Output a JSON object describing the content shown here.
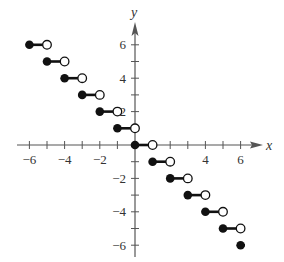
{
  "chart_data": {
    "type": "step",
    "title": "",
    "xlabel": "x",
    "ylabel": "y",
    "xlim": [
      -6.3,
      7
    ],
    "ylim": [
      -6.3,
      7
    ],
    "x_ticks": [
      -6,
      -5,
      -4,
      -3,
      -2,
      -1,
      1,
      2,
      3,
      4,
      5,
      6
    ],
    "x_tick_labels": [
      "-6",
      "-4",
      "-2",
      "4",
      "6"
    ],
    "x_tick_label_values": [
      -6,
      -4,
      -2,
      4,
      6
    ],
    "y_ticks": [
      -6,
      -5,
      -4,
      -3,
      -2,
      -1,
      1,
      2,
      3,
      4,
      5,
      6
    ],
    "y_tick_labels": [
      "6",
      "4",
      "2",
      "-2",
      "-4",
      "-6"
    ],
    "y_tick_label_values": [
      6,
      4,
      2,
      -2,
      -4,
      -6
    ],
    "grid": false,
    "function": "f(x) = -[[x]]",
    "segments": [
      {
        "x_start": -6,
        "x_end": -5,
        "y": 6,
        "start_closed": true,
        "end_closed": false
      },
      {
        "x_start": -5,
        "x_end": -4,
        "y": 5,
        "start_closed": true,
        "end_closed": false
      },
      {
        "x_start": -4,
        "x_end": -3,
        "y": 4,
        "start_closed": true,
        "end_closed": false
      },
      {
        "x_start": -3,
        "x_end": -2,
        "y": 3,
        "start_closed": true,
        "end_closed": false
      },
      {
        "x_start": -2,
        "x_end": -1,
        "y": 2,
        "start_closed": true,
        "end_closed": false
      },
      {
        "x_start": -1,
        "x_end": 0,
        "y": 1,
        "start_closed": true,
        "end_closed": false
      },
      {
        "x_start": 0,
        "x_end": 1,
        "y": 0,
        "start_closed": true,
        "end_closed": false
      },
      {
        "x_start": 1,
        "x_end": 2,
        "y": -1,
        "start_closed": true,
        "end_closed": false
      },
      {
        "x_start": 2,
        "x_end": 3,
        "y": -2,
        "start_closed": true,
        "end_closed": false
      },
      {
        "x_start": 3,
        "x_end": 4,
        "y": -3,
        "start_closed": true,
        "end_closed": false
      },
      {
        "x_start": 4,
        "x_end": 5,
        "y": -4,
        "start_closed": true,
        "end_closed": false
      },
      {
        "x_start": 5,
        "x_end": 6,
        "y": -5,
        "start_closed": true,
        "end_closed": false
      },
      {
        "x_start": 6,
        "x_end": 6.25,
        "y": -6,
        "start_closed": true,
        "end_closed": null
      }
    ]
  },
  "labels": {
    "x_axis": "x",
    "y_axis": "y"
  }
}
